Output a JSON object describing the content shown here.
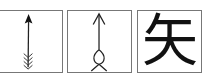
{
  "panels": [
    {
      "name": "oracle-bone-arrow",
      "description": "pictograph arrow with fletching"
    },
    {
      "name": "bronze-arrow",
      "description": "arrow with looped tail"
    },
    {
      "name": "modern-character",
      "character": "矢"
    }
  ]
}
